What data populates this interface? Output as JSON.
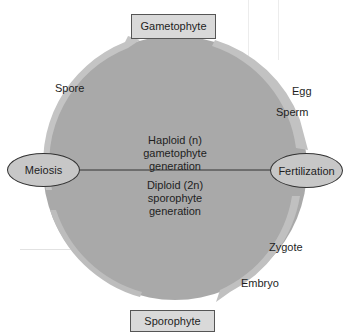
{
  "diagram": {
    "colors": {
      "circle_fill": "#a9a9a9",
      "arrow_fill": "#bdbdbd",
      "box_fill": "#d9d9d9",
      "ellipse_fill": "#c7c7c7",
      "line": "#333333"
    },
    "top_box": "Gametophyte",
    "bottom_box": "Sporophyte",
    "left_node": "Meiosis",
    "right_node": "Fertilization",
    "upper_half": {
      "line1": "Haploid (n)",
      "line2": "gametophyte",
      "line3": "generation"
    },
    "lower_half": {
      "line1": "Diploid (2n)",
      "line2": "sporophyte",
      "line3": "generation"
    },
    "cycle_labels": {
      "spore": "Spore",
      "egg": "Egg",
      "sperm": "Sperm",
      "zygote": "Zygote",
      "embryo": "Embryo"
    }
  }
}
